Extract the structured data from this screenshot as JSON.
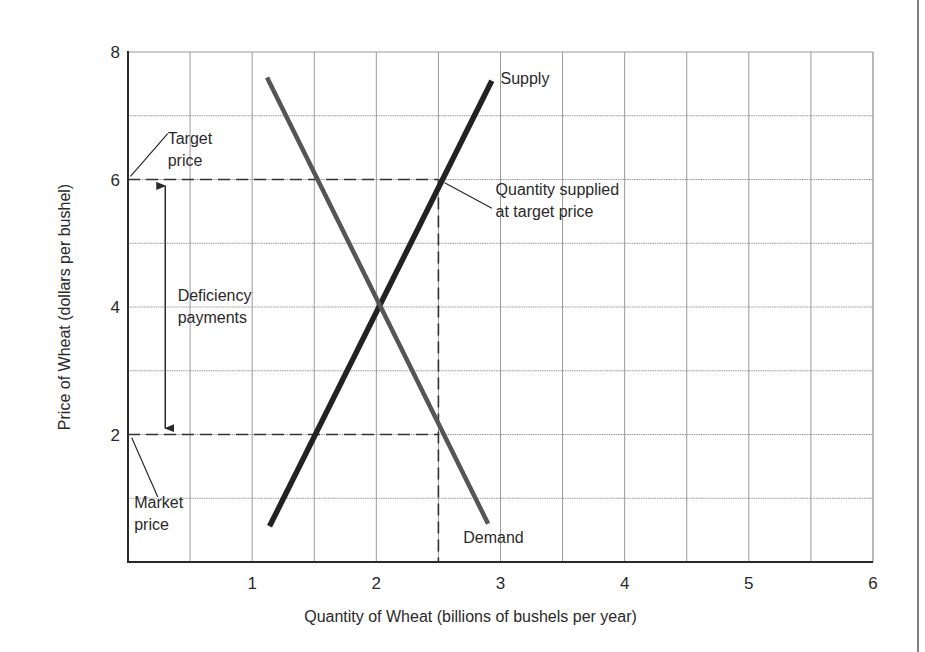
{
  "chart_data": {
    "type": "line",
    "title": "",
    "xlabel": "Quantity of Wheat (billions of bushels per year)",
    "ylabel": "Price of Wheat (dollars per bushel)",
    "xlim": [
      0,
      6
    ],
    "ylim": [
      0,
      8
    ],
    "grid": true,
    "x_grid_step": 0.5,
    "y_grid_step": 1,
    "x_ticks": [
      {
        "value": 1,
        "label": "1"
      },
      {
        "value": 2,
        "label": "2"
      },
      {
        "value": 3,
        "label": "3"
      },
      {
        "value": 4,
        "label": "4"
      },
      {
        "value": 5,
        "label": "5"
      },
      {
        "value": 6,
        "label": "6"
      }
    ],
    "y_ticks": [
      {
        "value": 2,
        "label": "2"
      },
      {
        "value": 4,
        "label": "4"
      },
      {
        "value": 6,
        "label": "6"
      },
      {
        "value": 8,
        "label": "8"
      }
    ],
    "series": [
      {
        "name": "Supply",
        "label": "Supply",
        "color": "#222222",
        "points": [
          [
            1.14,
            0.56
          ],
          [
            2.0,
            4.0
          ],
          [
            2.5,
            6.0
          ],
          [
            2.93,
            7.55
          ]
        ]
      },
      {
        "name": "Demand",
        "label": "Demand",
        "color": "#555555",
        "points": [
          [
            1.12,
            7.6
          ],
          [
            2.0,
            4.0
          ],
          [
            2.5,
            2.0
          ],
          [
            2.9,
            0.6
          ]
        ]
      }
    ],
    "reference_lines": [
      {
        "name": "target-price-line",
        "from": [
          0,
          6
        ],
        "to": [
          2.5,
          6
        ],
        "style": "dashed"
      },
      {
        "name": "market-price-line",
        "from": [
          0,
          2
        ],
        "to": [
          2.5,
          2
        ],
        "style": "dashed"
      },
      {
        "name": "quantity-supplied-line",
        "from": [
          2.5,
          6
        ],
        "to": [
          2.5,
          0
        ],
        "style": "dashed"
      }
    ],
    "arrow": {
      "name": "deficiency-payments-arrow",
      "x": 0.3,
      "y_from": 2.1,
      "y_to": 5.9
    },
    "annotations": [
      {
        "name": "target-price-label",
        "lines": [
          "Target",
          "price"
        ],
        "text_at": [
          0.32,
          6.55
        ],
        "leader_from": [
          0.02,
          6.05
        ],
        "leader_to": [
          0.32,
          6.72
        ]
      },
      {
        "name": "market-price-label",
        "lines": [
          "Market",
          "price"
        ],
        "text_at": [
          0.05,
          0.85
        ],
        "leader_from": [
          0.03,
          1.95
        ],
        "leader_to": [
          0.24,
          1.02
        ]
      },
      {
        "name": "deficiency-payments-label",
        "lines": [
          "Deficiency",
          "payments"
        ],
        "text_at": [
          0.4,
          4.1
        ]
      },
      {
        "name": "quantity-supplied-label",
        "lines": [
          "Quantity supplied",
          "at target price"
        ],
        "text_at": [
          2.96,
          5.75
        ],
        "leader_from": [
          2.55,
          5.95
        ],
        "leader_to": [
          2.93,
          5.55
        ]
      },
      {
        "name": "supply-curve-label",
        "lines": [
          "Supply"
        ],
        "text_at": [
          3.0,
          7.5
        ]
      },
      {
        "name": "demand-curve-label",
        "lines": [
          "Demand"
        ],
        "text_at": [
          2.7,
          0.3
        ]
      }
    ]
  }
}
